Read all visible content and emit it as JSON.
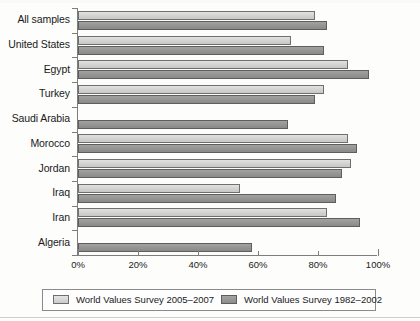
{
  "chart_data": {
    "type": "bar",
    "orientation": "horizontal",
    "title": "",
    "xlabel": "",
    "ylabel": "",
    "xlim": [
      0,
      100
    ],
    "xunit": "%",
    "grid": false,
    "legend_position": "bottom",
    "categories": [
      "All samples",
      "United States",
      "Egypt",
      "Turkey",
      "Saudi Arabia",
      "Morocco",
      "Jordan",
      "Iraq",
      "Iran",
      "Algeria"
    ],
    "xticks": [
      0,
      20,
      40,
      60,
      80,
      100
    ],
    "xtick_labels": [
      "0%",
      "20%",
      "40%",
      "60%",
      "80%",
      "100%"
    ],
    "series": [
      {
        "name": "World Values Survey 2005–2007",
        "color": "#d5d5d3",
        "values": [
          79,
          71,
          90,
          82,
          null,
          90,
          91,
          54,
          83,
          null
        ]
      },
      {
        "name": "World Values Survey 1982–2002",
        "color": "#949492",
        "values": [
          83,
          82,
          97,
          79,
          70,
          93,
          88,
          86,
          94,
          58
        ]
      }
    ]
  },
  "legend": {
    "entries": [
      {
        "label": "World Values Survey 2005–2007",
        "swatch": "light"
      },
      {
        "label": "World Values Survey 1982–2002",
        "swatch": "dark"
      }
    ]
  }
}
